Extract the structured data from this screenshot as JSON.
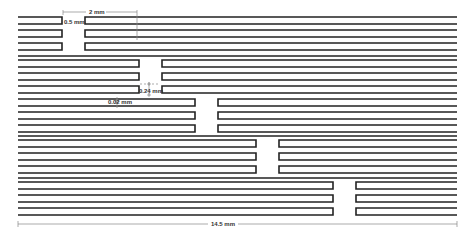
{
  "diagram": {
    "type": "staggered-interdigitated-strip-layout",
    "groups": 5,
    "rows_per_group": 3,
    "gap_positions_px": [
      {
        "group": 1,
        "left_end": 62,
        "right_start": 85
      },
      {
        "group": 2,
        "left_end": 139,
        "right_start": 162
      },
      {
        "group": 3,
        "left_end": 195,
        "right_start": 218
      },
      {
        "group": 4,
        "left_end": 256,
        "right_start": 279
      },
      {
        "group": 5,
        "left_end": 333,
        "right_start": 356
      }
    ],
    "stroke_color": "#222222",
    "dimension_color": "#888888"
  },
  "dimensions": {
    "gap_width": "0.5 mm",
    "segment_length": "2 mm",
    "strip_spacing": "0.24 mm",
    "strip_height": "0.02 mm",
    "total_width": "14.5 mm"
  }
}
